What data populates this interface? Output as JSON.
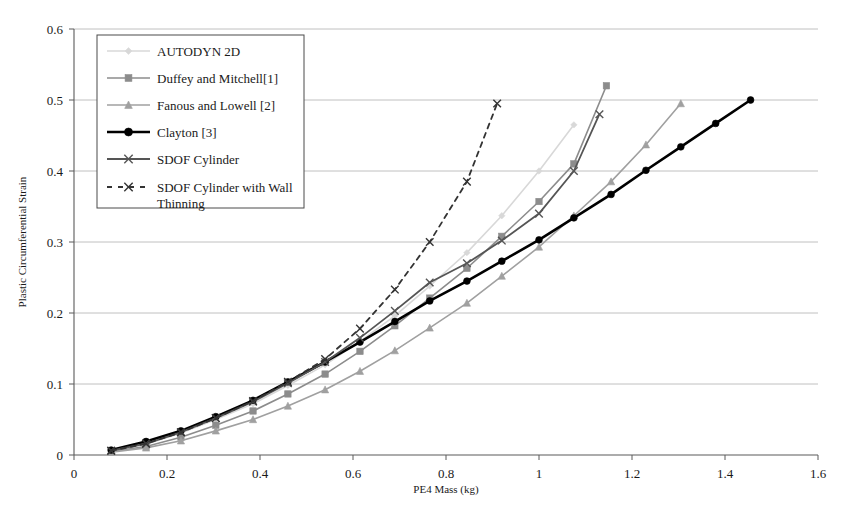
{
  "chart_data": {
    "type": "line",
    "title": "",
    "xlabel": "PE4 Mass (kg)",
    "ylabel": "Plastic Circumferential Strain",
    "xlim": [
      0,
      1.6
    ],
    "ylim": [
      0,
      0.6
    ],
    "xticks": [
      "0",
      "0.2",
      "0.4",
      "0.6",
      "0.8",
      "1",
      "1.2",
      "1.4",
      "1.6"
    ],
    "xtick_values": [
      0,
      0.2,
      0.4,
      0.6,
      0.8,
      1.0,
      1.2,
      1.4,
      1.6
    ],
    "yticks": [
      "0",
      "0.1",
      "0.2",
      "0.3",
      "0.4",
      "0.5",
      "0.6"
    ],
    "ytick_values": [
      0,
      0.1,
      0.2,
      0.3,
      0.4,
      0.5,
      0.6
    ],
    "grid": "horizontal",
    "legend_position": "top-left-inside",
    "series": [
      {
        "name": "AUTODYN 2D",
        "color": "#d8d8d8",
        "marker": "diamond",
        "dash": "none",
        "width": 1.6,
        "x": [
          0.08,
          0.155,
          0.23,
          0.305,
          0.385,
          0.46,
          0.54,
          0.615,
          0.69,
          0.765,
          0.845,
          0.92,
          1.0,
          1.075
        ],
        "y": [
          0.006,
          0.015,
          0.031,
          0.05,
          0.072,
          0.098,
          0.127,
          0.16,
          0.196,
          0.238,
          0.285,
          0.337,
          0.4,
          0.465
        ]
      },
      {
        "name": "Duffey and Mitchell[1]",
        "color": "#8c8c8c",
        "marker": "square",
        "dash": "none",
        "width": 1.6,
        "x": [
          0.08,
          0.155,
          0.23,
          0.305,
          0.385,
          0.46,
          0.54,
          0.615,
          0.69,
          0.765,
          0.845,
          0.92,
          1.0,
          1.075,
          1.145
        ],
        "y": [
          0.005,
          0.012,
          0.025,
          0.042,
          0.062,
          0.086,
          0.114,
          0.146,
          0.182,
          0.221,
          0.263,
          0.308,
          0.357,
          0.41,
          0.52
        ]
      },
      {
        "name": "Fanous and Lowell [2]",
        "color": "#a0a0a0",
        "marker": "triangle",
        "dash": "none",
        "width": 1.6,
        "x": [
          0.08,
          0.155,
          0.23,
          0.305,
          0.385,
          0.46,
          0.54,
          0.615,
          0.69,
          0.765,
          0.845,
          0.92,
          1.0,
          1.075,
          1.155,
          1.23,
          1.305
        ],
        "y": [
          0.004,
          0.01,
          0.02,
          0.034,
          0.05,
          0.069,
          0.092,
          0.118,
          0.147,
          0.179,
          0.214,
          0.252,
          0.293,
          0.337,
          0.385,
          0.437,
          0.495
        ]
      },
      {
        "name": "Clayton [3]",
        "color": "#000000",
        "marker": "circle",
        "dash": "none",
        "width": 2.6,
        "x": [
          0.08,
          0.155,
          0.23,
          0.305,
          0.385,
          0.46,
          0.54,
          0.615,
          0.69,
          0.765,
          0.845,
          0.92,
          1.0,
          1.075,
          1.155,
          1.23,
          1.305,
          1.38,
          1.455
        ],
        "y": [
          0.007,
          0.019,
          0.034,
          0.054,
          0.077,
          0.103,
          0.131,
          0.159,
          0.188,
          0.217,
          0.245,
          0.273,
          0.303,
          0.334,
          0.367,
          0.401,
          0.434,
          0.467,
          0.5
        ]
      },
      {
        "name": "SDOF Cylinder",
        "color": "#555555",
        "marker": "x",
        "dash": "none",
        "width": 1.8,
        "x": [
          0.08,
          0.155,
          0.23,
          0.305,
          0.385,
          0.46,
          0.54,
          0.615,
          0.69,
          0.765,
          0.845,
          0.92,
          1.0,
          1.075,
          1.13
        ],
        "y": [
          0.006,
          0.016,
          0.032,
          0.052,
          0.075,
          0.101,
          0.131,
          0.165,
          0.203,
          0.243,
          0.27,
          0.302,
          0.34,
          0.4,
          0.48
        ]
      },
      {
        "name": "SDOF Cylinder with Wall Thinning",
        "color": "#333333",
        "marker": "x",
        "dash": "dashed",
        "width": 1.8,
        "x": [
          0.08,
          0.155,
          0.23,
          0.305,
          0.385,
          0.46,
          0.54,
          0.615,
          0.69,
          0.765,
          0.845,
          0.91
        ],
        "y": [
          0.006,
          0.016,
          0.032,
          0.052,
          0.076,
          0.103,
          0.135,
          0.178,
          0.233,
          0.3,
          0.385,
          0.495
        ]
      }
    ]
  },
  "legend": {
    "entries": [
      {
        "label": "AUTODYN 2D"
      },
      {
        "label": "Duffey and Mitchell[1]"
      },
      {
        "label": "Fanous and Lowell [2]"
      },
      {
        "label": "Clayton [3]"
      },
      {
        "label": "SDOF Cylinder"
      },
      {
        "label": "SDOF Cylinder with Wall"
      },
      {
        "label": "Thinning"
      }
    ]
  }
}
